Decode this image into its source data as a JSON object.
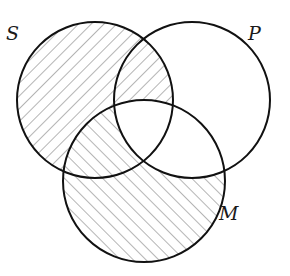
{
  "diagram": {
    "type": "venn",
    "sets": [
      {
        "id": "S",
        "label": "S",
        "cx": 95,
        "cy": 100,
        "r": 78,
        "label_x": 6,
        "label_y": 40
      },
      {
        "id": "P",
        "label": "P",
        "cx": 192,
        "cy": 100,
        "r": 78,
        "label_x": 248,
        "label_y": 40
      },
      {
        "id": "M",
        "label": "M",
        "cx": 144,
        "cy": 181,
        "r": 81,
        "label_x": 219,
        "label_y": 220
      }
    ],
    "regions": {
      "S_only": "hatch-backslash",
      "S_and_P_not_M": "hatch-backslash",
      "S_and_M_not_P": "hatch-slash",
      "S_and_P_and_M": "empty",
      "M_only": "hatch-slash",
      "M_and_P_not_S": "empty",
      "P_only": "empty"
    },
    "colors": {
      "outline": "#111111",
      "hatch": "#6b6b6b",
      "background": "#ffffff"
    }
  }
}
